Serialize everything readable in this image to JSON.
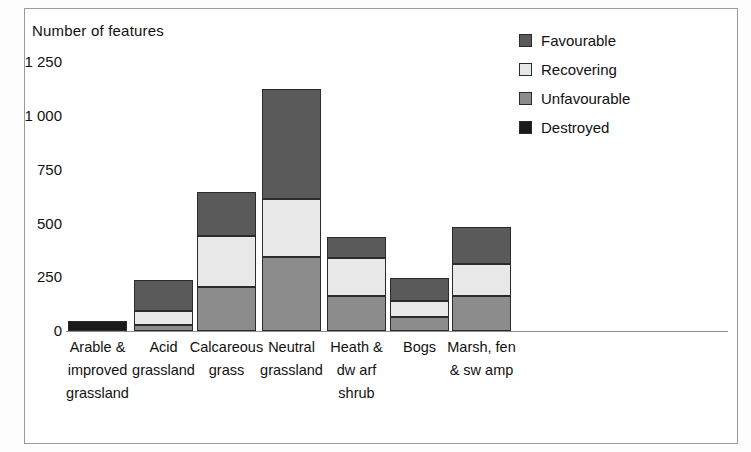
{
  "chart_data": {
    "type": "bar",
    "subtype": "stacked",
    "title": "",
    "xlabel": "",
    "ylabel": "Number of features",
    "ylim": [
      0,
      1250
    ],
    "yticks": [
      0,
      250,
      500,
      750,
      1000,
      1250
    ],
    "ytick_labels": [
      "0",
      "250",
      "500",
      "750",
      "1 000",
      "1 250"
    ],
    "grid": false,
    "legend_position": "top-right",
    "stack_order_bottom_to_top": [
      "Unfavourable",
      "Recovering",
      "Favourable"
    ],
    "categories": [
      "Arable & improved grassland",
      "Acid grassland",
      "Calcareous grass",
      "Neutral grassland",
      "Heath & dwarf shrub",
      "Bogs",
      "Marsh, fen & swamp"
    ],
    "series": [
      {
        "name": "Favourable",
        "color": "#5a5a5a",
        "values": [
          0,
          140,
          205,
          510,
          95,
          105,
          175
        ]
      },
      {
        "name": "Recovering",
        "color": "#e8e8e8",
        "values": [
          0,
          65,
          235,
          270,
          175,
          75,
          145
        ]
      },
      {
        "name": "Unfavourable",
        "color": "#8c8c8c",
        "values": [
          0,
          30,
          205,
          345,
          165,
          65,
          165
        ]
      },
      {
        "name": "Destroyed",
        "color": "#1a1a1a",
        "values": [
          45,
          0,
          0,
          0,
          0,
          0,
          0
        ]
      }
    ],
    "totals": [
      45,
      235,
      645,
      1125,
      430,
      245,
      485
    ]
  },
  "chart": {
    "y_axis_title": "Number of features",
    "y_ticks": [
      {
        "label": "1 250",
        "value": 1250
      },
      {
        "label": "1 000",
        "value": 1000
      },
      {
        "label": "750",
        "value": 750
      },
      {
        "label": "500",
        "value": 500
      },
      {
        "label": "250",
        "value": 250
      },
      {
        "label": "0",
        "value": 0
      }
    ],
    "legend": [
      {
        "label": "Favourable",
        "color": "#5a5a5a"
      },
      {
        "label": "Recovering",
        "color": "#e8e8e8"
      },
      {
        "label": "Unfavourable",
        "color": "#8c8c8c"
      },
      {
        "label": "Destroyed",
        "color": "#1a1a1a"
      }
    ],
    "x_labels": [
      "Arable &\nimproved\ngrassland",
      "Acid\ngrassland",
      "Calcareous\ngrass",
      "Neutral\ngrassland",
      "Heath &\ndw arf\nshrub",
      "Bogs",
      "Marsh, fen\n& sw amp"
    ]
  }
}
